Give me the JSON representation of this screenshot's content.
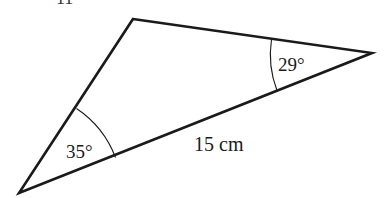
{
  "diagram": {
    "type": "triangle",
    "partial_heading": "11",
    "vertices": {
      "top": [
        133,
        19
      ],
      "right": [
        372,
        53
      ],
      "bottom_left": [
        19,
        193
      ]
    },
    "angles": [
      {
        "vertex": "bottom_left",
        "label": "35°",
        "value": 35
      },
      {
        "vertex": "right",
        "label": "29°",
        "value": 29
      }
    ],
    "sides": [
      {
        "between": [
          "bottom_left",
          "right"
        ],
        "label": "15 cm",
        "length": 15,
        "unit": "cm"
      }
    ],
    "colors": {
      "stroke": "#1a1a1a",
      "background": "#ffffff"
    }
  }
}
